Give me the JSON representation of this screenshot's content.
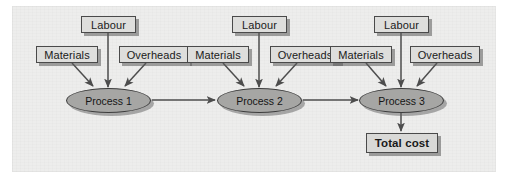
{
  "diagram": {
    "background_color": "#ededec",
    "box_fill": "#dededc",
    "box_border": "#4a4a4a",
    "ellipse_fill": "#a6a6a4",
    "ellipse_border": "#3d3d3d",
    "arrow_color": "#4d4d4d",
    "stages": [
      {
        "id": "stage-1",
        "labour_label": "Labour",
        "materials_label": "Materials",
        "overheads_label": "Overheads",
        "process_label": "Process 1"
      },
      {
        "id": "stage-2",
        "labour_label": "Labour",
        "materials_label": "Materials",
        "overheads_label": "Overheads",
        "process_label": "Process 2"
      },
      {
        "id": "stage-3",
        "labour_label": "Labour",
        "materials_label": "Materials",
        "overheads_label": "Overheads",
        "process_label": "Process 3"
      }
    ],
    "output": {
      "label": "Total cost"
    }
  }
}
